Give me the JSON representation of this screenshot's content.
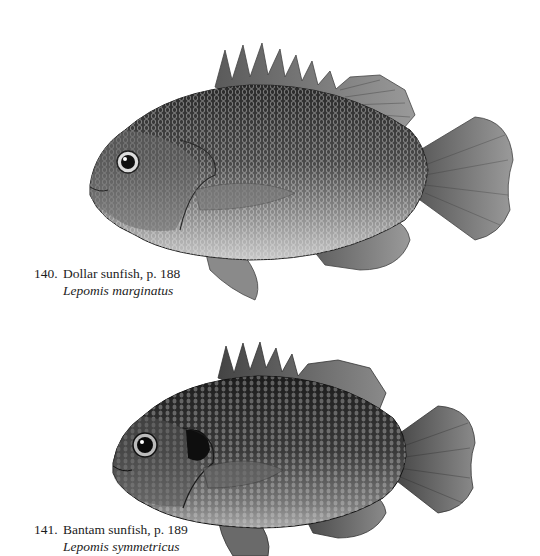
{
  "plates": [
    {
      "number": "140.",
      "common_name": "Dollar sunfish, p. 188",
      "scientific_name": "Lepomis marginatus",
      "illustration": "dollar-sunfish-illustration"
    },
    {
      "number": "141.",
      "common_name": "Bantam sunfish, p. 189",
      "scientific_name": "Lepomis symmetricus",
      "illustration": "bantam-sunfish-illustration"
    }
  ],
  "colors": {
    "background": "#ffffff",
    "ink": "#1c1c1c"
  }
}
